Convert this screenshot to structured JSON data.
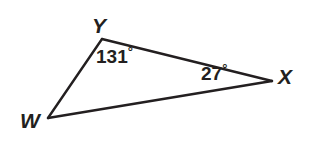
{
  "figure": {
    "kind": "geometry-triangle-diagram",
    "background_color": "#ffffff",
    "stroke_color": "#231f20",
    "text_color": "#231f20",
    "stroke_width": 2.4,
    "width": 316,
    "height": 146
  },
  "triangle": {
    "name": "triangle-WYX",
    "vertices": [
      {
        "id": "Y",
        "label": "Y",
        "x": 102,
        "y": 39
      },
      {
        "id": "X",
        "label": "X",
        "x": 272,
        "y": 81
      },
      {
        "id": "W",
        "label": "W",
        "x": 48,
        "y": 118
      }
    ],
    "sides": [
      {
        "name": "side-WY",
        "from": "W",
        "to": "Y"
      },
      {
        "name": "side-YX",
        "from": "Y",
        "to": "X"
      },
      {
        "name": "side-WX",
        "from": "W",
        "to": "X"
      }
    ]
  },
  "angles": [
    {
      "id": "angle-Y",
      "at_vertex": "Y",
      "value": "131",
      "degree_symbol": "°",
      "text": "131°"
    },
    {
      "id": "angle-X",
      "at_vertex": "X",
      "value": "27",
      "degree_symbol": "°",
      "text": "27°"
    }
  ],
  "labels": {
    "vertex_Y": "Y",
    "vertex_W": "W",
    "vertex_X": "X",
    "angle_Y_value": "131",
    "angle_Y_degree": "°",
    "angle_X_value": "27",
    "angle_X_degree": "°"
  }
}
